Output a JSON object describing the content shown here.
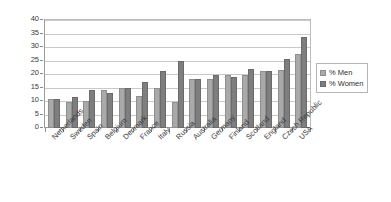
{
  "chart_data": {
    "type": "bar",
    "title": "",
    "xlabel": "",
    "ylabel": "",
    "ylim": [
      0,
      40
    ],
    "yticks": [
      0,
      5,
      10,
      15,
      20,
      25,
      30,
      35,
      40
    ],
    "grid": true,
    "legend_position": "right",
    "categories": [
      "Netherlands",
      "Sweden",
      "Spain",
      "Belgium",
      "Denmark",
      "France",
      "Italy",
      "Russia",
      "Australia",
      "Germany",
      "Finland",
      "Scotland",
      "England",
      "Czech Republic",
      "USA"
    ],
    "series": [
      {
        "name": "% Men",
        "color": "#a9a9a9",
        "values": [
          10.8,
          9.8,
          9.9,
          14.0,
          15.0,
          11.8,
          15.0,
          9.7,
          18.3,
          18.0,
          19.8,
          19.8,
          21.0,
          21.6,
          27.3
        ]
      },
      {
        "name": "% Women",
        "color": "#7e7e7e",
        "values": [
          10.8,
          11.6,
          14.0,
          13.0,
          15.0,
          17.0,
          21.0,
          24.8,
          18.2,
          19.7,
          19.0,
          21.7,
          21.3,
          25.7,
          33.7
        ]
      }
    ]
  },
  "legend": {
    "items": [
      {
        "label": "% Men",
        "swatch": "men-swatch"
      },
      {
        "label": "% Women",
        "swatch": "women-swatch"
      }
    ]
  }
}
